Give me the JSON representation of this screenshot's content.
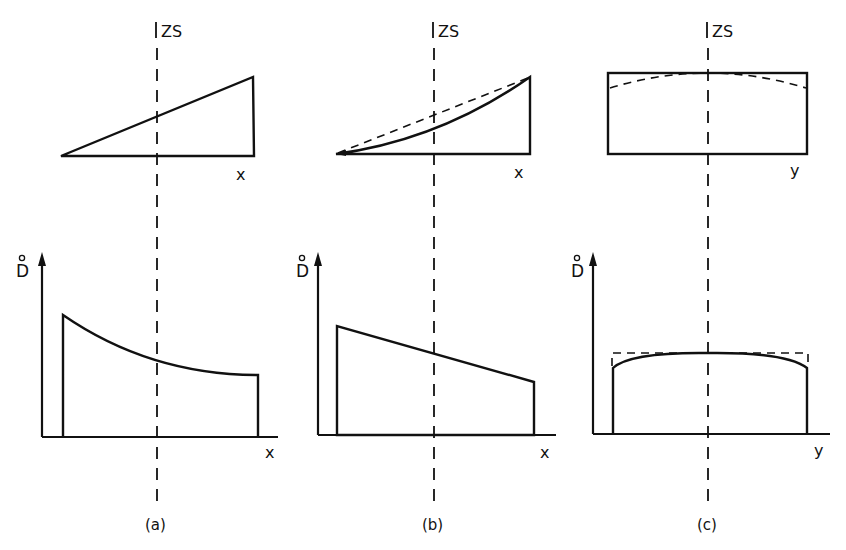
{
  "figure": {
    "background": "#ffffff",
    "ink": "#111111",
    "symmetry_label": "ZS",
    "panels": [
      {
        "id": "a",
        "caption": "(a)",
        "top": {
          "axis_label": "x",
          "shape": "linear-wedge"
        },
        "bottom": {
          "y_label": "D",
          "y_label_accent": "°",
          "x_label": "x",
          "profile": "decreasing convex curve"
        }
      },
      {
        "id": "b",
        "caption": "(b)",
        "top": {
          "axis_label": "x",
          "shape": "concave wedge with dashed linear reference"
        },
        "bottom": {
          "y_label": "D",
          "y_label_accent": "°",
          "x_label": "x",
          "profile": "decreasing linear"
        }
      },
      {
        "id": "c",
        "caption": "(c)",
        "top": {
          "axis_label": "y",
          "shape": "rectangle with dashed curved top"
        },
        "bottom": {
          "y_label": "D",
          "y_label_accent": "°",
          "x_label": "y",
          "profile": "flat dome with dashed rectangular reference"
        }
      }
    ]
  }
}
